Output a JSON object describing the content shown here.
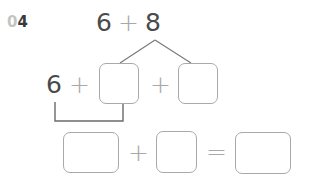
{
  "question": {
    "number_prefix": "0",
    "number_digit": "4"
  },
  "top_expression": {
    "left": "6",
    "operator": "+",
    "right": "8"
  },
  "decomposition_row": {
    "first": "6",
    "op1": "+",
    "box1_value": "",
    "op2": "+",
    "box2_value": ""
  },
  "result_row": {
    "boxA_value": "",
    "op": "+",
    "boxB_value": "",
    "equals": "=",
    "boxC_value": ""
  },
  "colors": {
    "text": "#4a4a4a",
    "operator": "#a8a8a8",
    "line": "#7a7a7a",
    "box_border": "#a9a9a9"
  }
}
